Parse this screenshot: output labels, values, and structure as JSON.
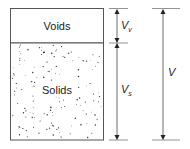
{
  "diagram": {
    "phases": [
      {
        "name": "Voids",
        "label": "Voids",
        "fill": "#ffffff"
      },
      {
        "name": "Solids",
        "label": "Solids",
        "fill": "#ffffff",
        "pattern": "speckled dots"
      }
    ],
    "dimensions": [
      {
        "symbol": "V",
        "subscript": "v",
        "meaning": "volume of voids"
      },
      {
        "symbol": "V",
        "subscript": "s",
        "meaning": "volume of solids"
      },
      {
        "symbol": "V",
        "subscript": "",
        "meaning": "total volume"
      }
    ],
    "colors": {
      "stroke": "#555555",
      "dot": "#333333",
      "text": "#222222"
    }
  }
}
